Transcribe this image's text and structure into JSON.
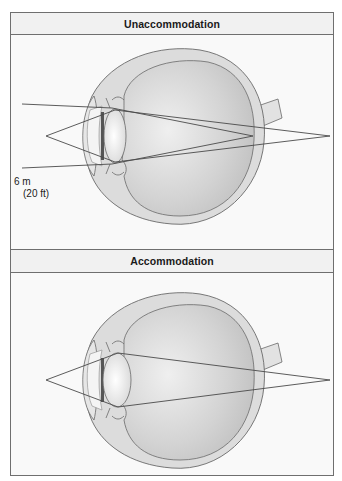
{
  "figure": {
    "panels": [
      {
        "id": "unaccommodation",
        "title": "Unaccommodation",
        "distance_label": {
          "line1": "6 m",
          "line2": "(20 ft)"
        },
        "lens_state": "flattened",
        "object_point": [
          46,
          136
        ],
        "image_point_far": [
          330,
          136
        ],
        "retina_focus_point": [
          253,
          136
        ],
        "parallel_rays_y": [
          104,
          168
        ]
      },
      {
        "id": "accommodation",
        "title": "Accommodation",
        "lens_state": "rounded",
        "object_point": [
          46,
          380
        ],
        "image_point_far": [
          330,
          380
        ]
      }
    ],
    "colors": {
      "frame": "#6f6f6f",
      "header_bg": "#f1f1f1",
      "sclera": "#dcdcdc",
      "vitreous": "#c9c9c9",
      "lens": "#ececec",
      "ray": "#4a4a4a",
      "outline": "#6a6a6a"
    }
  }
}
